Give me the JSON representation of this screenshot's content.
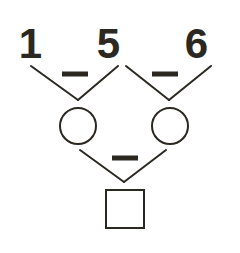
{
  "diagram": {
    "type": "arithmetic-tree",
    "colors": {
      "stroke": "#2b2721",
      "background": "#ffffff"
    },
    "top_row": {
      "digits": [
        {
          "label": "1",
          "x": 30,
          "y": 58
        },
        {
          "label": "5",
          "x": 108,
          "y": 58
        },
        {
          "label": "6",
          "x": 196,
          "y": 58
        }
      ]
    },
    "operators": {
      "left_minus": {
        "label": "−",
        "x1": 62,
        "x2": 88,
        "y": 74
      },
      "right_minus": {
        "label": "−",
        "x1": 152,
        "x2": 178,
        "y": 74
      },
      "bottom_minus": {
        "label": "−",
        "x1": 112,
        "x2": 138,
        "y": 158
      }
    },
    "connectors": [
      {
        "name": "left-v-left-arm",
        "x1": 31,
        "y1": 66,
        "x2": 78,
        "y2": 100
      },
      {
        "name": "left-v-right-arm",
        "x1": 78,
        "y1": 100,
        "x2": 118,
        "y2": 66
      },
      {
        "name": "right-v-left-arm",
        "x1": 126,
        "y1": 66,
        "x2": 169,
        "y2": 100
      },
      {
        "name": "right-v-right-arm",
        "x1": 169,
        "y1": 100,
        "x2": 211,
        "y2": 66
      },
      {
        "name": "bottom-v-left-arm",
        "x1": 80,
        "y1": 150,
        "x2": 124,
        "y2": 182
      },
      {
        "name": "bottom-v-right-arm",
        "x1": 124,
        "y1": 182,
        "x2": 166,
        "y2": 150
      }
    ],
    "nodes": [
      {
        "name": "left-circle",
        "shape": "circle",
        "value": "",
        "cx": 78,
        "cy": 126,
        "r": 18
      },
      {
        "name": "right-circle",
        "shape": "circle",
        "value": "",
        "cx": 170,
        "cy": 126,
        "r": 18
      },
      {
        "name": "result-square",
        "shape": "square",
        "value": "",
        "x": 106,
        "y": 190,
        "size": 38
      }
    ]
  }
}
